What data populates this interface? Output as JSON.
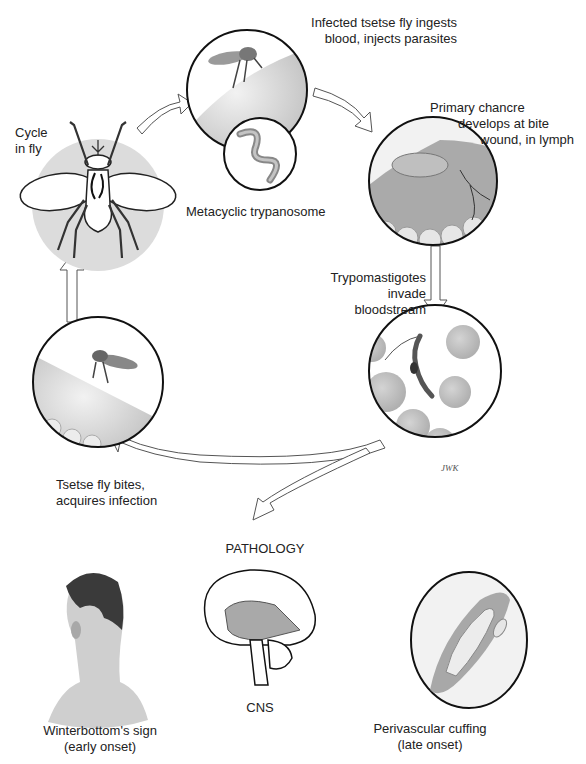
{
  "diagram": {
    "cycle_stages": [
      {
        "id": "cycle-in-fly",
        "label": "Cycle\nin fly",
        "lines": [
          "Cycle",
          "in fly"
        ]
      },
      {
        "id": "fly-injects",
        "lines": [
          "Infected tsetse fly ingests",
          "blood, injects parasites"
        ]
      },
      {
        "id": "metacyclic",
        "lines": [
          "Metacyclic trypanosome"
        ]
      },
      {
        "id": "chancre",
        "lines": [
          "Primary chancre",
          "develops at bite",
          "wound, in lymph"
        ]
      },
      {
        "id": "bloodstream",
        "lines": [
          "Trypomastigotes invade",
          "bloodstream"
        ]
      },
      {
        "id": "fly-bites",
        "lines": [
          "Tsetse fly bites,",
          "acquires infection"
        ]
      }
    ],
    "pathology": {
      "heading": "PATHOLOGY",
      "items": [
        {
          "id": "winterbottom",
          "lines": [
            "Winterbottom's sign",
            "(early onset)"
          ]
        },
        {
          "id": "cns",
          "lines": [
            "CNS"
          ]
        },
        {
          "id": "perivascular",
          "lines": [
            "Perivascular cuffing",
            "(late onset)"
          ]
        }
      ]
    },
    "signature": "JWK",
    "colors": {
      "outline": "#1a1a1a",
      "fly_circle_fill": "#d9d9d9",
      "skin": "#cfcfcf",
      "rbc": "#bdbdbd",
      "arrow": "#ffffff"
    }
  }
}
